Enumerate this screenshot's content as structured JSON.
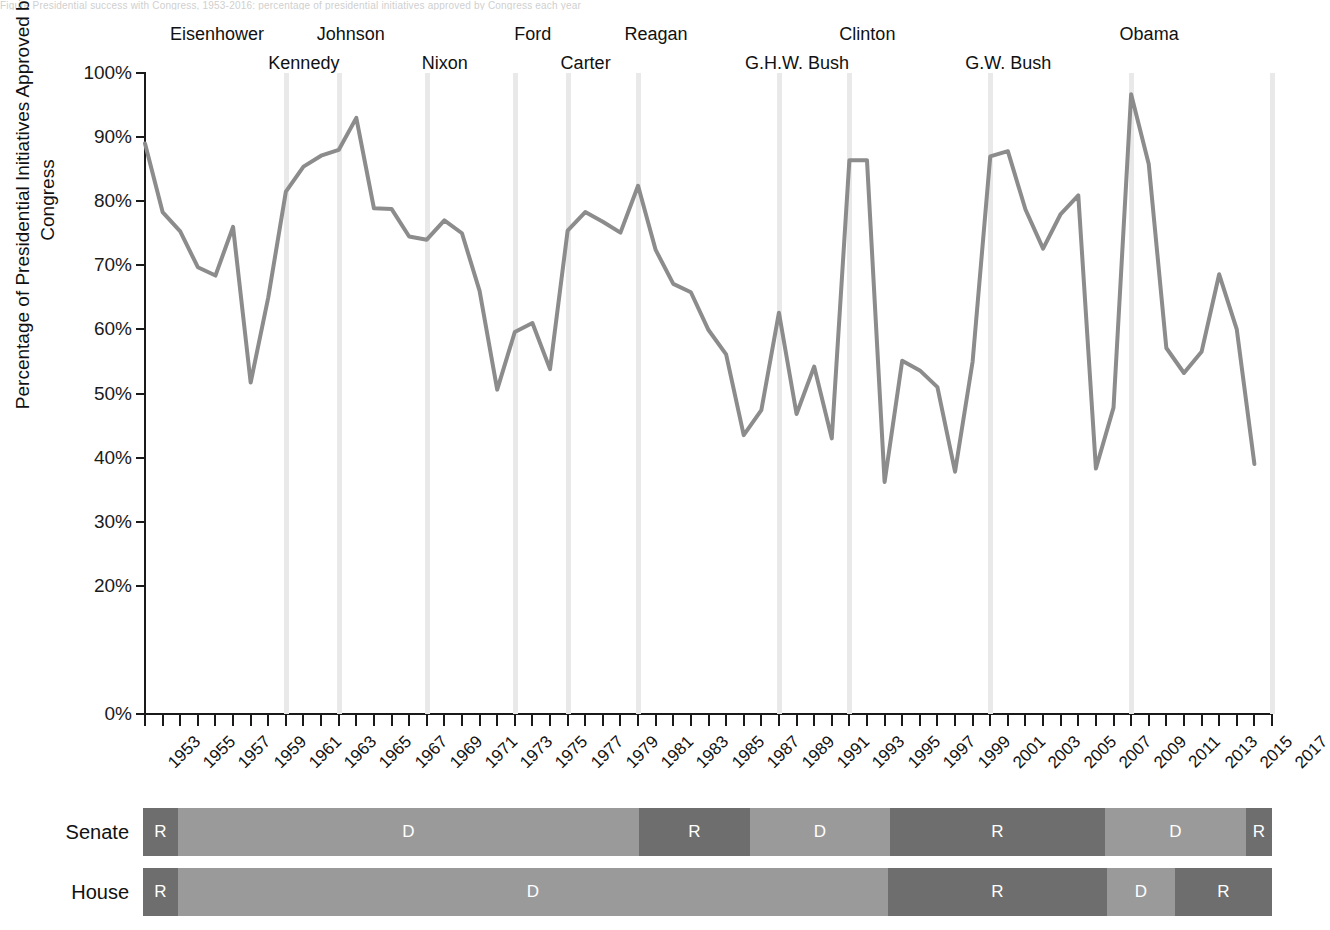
{
  "page": {
    "cut_off_header_text": "Figure   Presidential success with Congress, 1953-2016: percentage of presidential initiatives approved by Congress each year"
  },
  "chart_data": {
    "type": "line",
    "title": "",
    "xlabel": "",
    "ylabel": "Percentage of Presidential Initiatives Approved by Congress",
    "ylim": [
      0,
      100
    ],
    "xlim": [
      1953,
      2017
    ],
    "grid": false,
    "legend": "none",
    "ytick_labels": [
      "100%",
      "90%",
      "80%",
      "70%",
      "60%",
      "50%",
      "40%",
      "30%",
      "20%",
      "0%"
    ],
    "ytick_values": [
      100,
      90,
      80,
      70,
      60,
      50,
      40,
      30,
      20,
      0
    ],
    "xtick_labels": [
      "1953",
      "1955",
      "1957",
      "1959",
      "1961",
      "1963",
      "1965",
      "1967",
      "1969",
      "1971",
      "1973",
      "1975",
      "1977",
      "1979",
      "1981",
      "1983",
      "1985",
      "1987",
      "1989",
      "1991",
      "1993",
      "1995",
      "1997",
      "1999",
      "2001",
      "2003",
      "2005",
      "2007",
      "2009",
      "2011",
      "2013",
      "2015",
      "2017"
    ],
    "x": [
      1953,
      1954,
      1955,
      1956,
      1957,
      1958,
      1959,
      1960,
      1961,
      1962,
      1963,
      1964,
      1965,
      1966,
      1967,
      1968,
      1969,
      1970,
      1971,
      1972,
      1973,
      1974,
      1975,
      1976,
      1977,
      1978,
      1979,
      1980,
      1981,
      1982,
      1983,
      1984,
      1985,
      1986,
      1987,
      1988,
      1989,
      1990,
      1991,
      1992,
      1993,
      1994,
      1995,
      1996,
      1997,
      1998,
      1999,
      2000,
      2001,
      2002,
      2003,
      2004,
      2005,
      2006,
      2007,
      2008,
      2009,
      2010,
      2011,
      2012,
      2013,
      2014,
      2015,
      2016
    ],
    "values": [
      89.0,
      78.3,
      75.3,
      69.7,
      68.4,
      76.0,
      51.7,
      65.0,
      81.5,
      85.4,
      87.1,
      88.0,
      93.0,
      78.9,
      78.8,
      74.5,
      74.0,
      77.0,
      75.0,
      66.0,
      50.6,
      59.6,
      61.0,
      53.8,
      75.4,
      78.3,
      76.8,
      75.1,
      82.4,
      72.4,
      67.1,
      65.8,
      59.9,
      56.1,
      43.5,
      47.4,
      62.6,
      46.8,
      54.2,
      43.0,
      86.4,
      86.4,
      36.2,
      55.1,
      53.6,
      51.0,
      37.8,
      55.0,
      87.0,
      87.8,
      78.7,
      72.6,
      78.0,
      80.9,
      38.3,
      47.8,
      96.7,
      85.8,
      57.1,
      53.2,
      56.5,
      68.6,
      60.0,
      39.0
    ],
    "president_markers": [
      {
        "name": "Eisenhower",
        "year": 1953,
        "row": 0,
        "band": false
      },
      {
        "name": "Kennedy",
        "year": 1961,
        "row": 1,
        "band": true
      },
      {
        "name": "Johnson",
        "year": 1964,
        "row": 0,
        "band": true
      },
      {
        "name": "Nixon",
        "year": 1969,
        "row": 1,
        "band": true
      },
      {
        "name": "Ford",
        "year": 1974,
        "row": 0,
        "band": true
      },
      {
        "name": "Carter",
        "year": 1977,
        "row": 1,
        "band": true
      },
      {
        "name": "Reagan",
        "year": 1981,
        "row": 0,
        "band": true
      },
      {
        "name": "G.H.W. Bush",
        "year": 1989,
        "row": 1,
        "band": true
      },
      {
        "name": "Clinton",
        "year": 1993,
        "row": 0,
        "band": true
      },
      {
        "name": "G.W. Bush",
        "year": 2001,
        "row": 1,
        "band": true
      },
      {
        "name": "Obama",
        "year": 2009,
        "row": 0,
        "band": true
      },
      {
        "name": "",
        "year": 2017,
        "row": 0,
        "band": true
      }
    ],
    "line_color": "#8c8c8c",
    "band_color": "#e9e9e9"
  },
  "congress": {
    "republican_color": "#6e6e6e",
    "democrat_color": "#9a9a9a",
    "rows": [
      {
        "name": "Senate",
        "segments": [
          {
            "label": "R",
            "party": "R",
            "start_px": 143,
            "end_px": 178
          },
          {
            "label": "D",
            "party": "D",
            "start_px": 178,
            "end_px": 639
          },
          {
            "label": "R",
            "party": "R",
            "start_px": 639,
            "end_px": 750
          },
          {
            "label": "D",
            "party": "D",
            "start_px": 750,
            "end_px": 890
          },
          {
            "label": "R",
            "party": "R",
            "start_px": 890,
            "end_px": 1105
          },
          {
            "label": "D",
            "party": "D",
            "start_px": 1105,
            "end_px": 1246
          },
          {
            "label": "R",
            "party": "R",
            "start_px": 1246,
            "end_px": 1272
          }
        ]
      },
      {
        "name": "House",
        "segments": [
          {
            "label": "R",
            "party": "R",
            "start_px": 143,
            "end_px": 178
          },
          {
            "label": "D",
            "party": "D",
            "start_px": 178,
            "end_px": 888
          },
          {
            "label": "R",
            "party": "R",
            "start_px": 888,
            "end_px": 1107
          },
          {
            "label": "D",
            "party": "D",
            "start_px": 1107,
            "end_px": 1175
          },
          {
            "label": "R",
            "party": "R",
            "start_px": 1175,
            "end_px": 1272
          }
        ]
      }
    ]
  }
}
